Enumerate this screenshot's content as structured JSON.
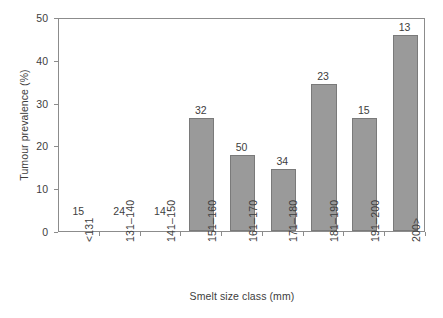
{
  "chart_data": {
    "type": "bar",
    "title": "",
    "subtitle": "",
    "xlabel": "Smelt size class (mm)",
    "ylabel": "Tumour prevalence (%)",
    "categories": [
      "<131",
      "131–140",
      "141–150",
      "151–160",
      "161–170",
      "171–180",
      "181–190",
      "191–200",
      "200>"
    ],
    "values": [
      0,
      0,
      0,
      26.4,
      17.8,
      14.5,
      34.4,
      26.4,
      45.8
    ],
    "point_labels": [
      "15",
      "24",
      "14",
      "32",
      "50",
      "34",
      "23",
      "15",
      "13"
    ],
    "point_label_meaning": "sample size (n) above each bar",
    "ylim": [
      0,
      50
    ],
    "yticks": [
      0,
      10,
      20,
      30,
      40,
      50
    ],
    "ytick_labels": [
      "0",
      "10",
      "20",
      "30",
      "40",
      "50"
    ],
    "grid": false,
    "legend": null,
    "bar_color": "#9a9a9a",
    "bar_edge_color": "#7a7a7a",
    "axis_color": "#8c8c8c",
    "text_color": "#3d3d3d"
  }
}
